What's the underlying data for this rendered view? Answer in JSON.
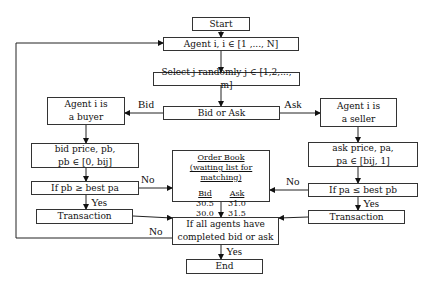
{
  "diagram": {
    "nodes": {
      "start": "Start",
      "agent_loop": "Agent i, i ∈ [1 ,..., N]",
      "select_j": "Select j randomly j ∈ [1,2,..., m]",
      "bid_or_ask": "Bid or Ask",
      "buyer_line1": "Agent i is",
      "buyer_line2": "a buyer",
      "seller_line1": "Agent i is",
      "seller_line2": "a seller",
      "bid_price_line1": "bid price, pb,",
      "bid_price_line2": "pb ∈ [0, bij]",
      "ask_price_line1": "ask price, pa,",
      "ask_price_line2": "pa ∈ [bij, 1]",
      "if_pb": "If pb ≥ best pa",
      "if_pa": "If pa ≤ best pb",
      "transaction_left": "Transaction",
      "transaction_right": "Transaction",
      "all_done_line1": "If all agents have",
      "all_done_line2": "completed bid or ask",
      "end": "End"
    },
    "order_book": {
      "title": "Order Book",
      "subtitle": "(waiting list for matching)",
      "headers": [
        "Bid",
        "Ask"
      ],
      "rows": [
        [
          "30.5",
          "31.0"
        ],
        [
          "30.0",
          "31.5"
        ]
      ]
    },
    "edge_labels": {
      "bid": "Bid",
      "ask": "Ask",
      "no_left": "No",
      "no_right": "No",
      "yes_left": "Yes",
      "yes_right": "Yes",
      "no_loop": "No",
      "yes_end": "Yes"
    }
  }
}
